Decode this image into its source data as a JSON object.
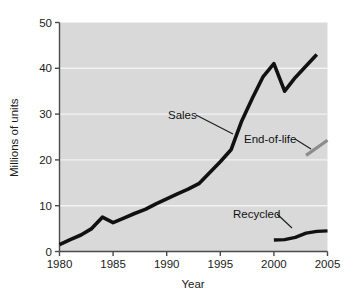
{
  "chart_data": {
    "type": "line",
    "title": "",
    "subtitle": "",
    "xlabel": "Year",
    "ylabel": "Millions of units",
    "xlim": [
      1980,
      2005
    ],
    "ylim": [
      0,
      50
    ],
    "xticks": [
      "1980",
      "1985",
      "1990",
      "1995",
      "2000",
      "2005"
    ],
    "yticks": [
      "0",
      "10",
      "20",
      "30",
      "40",
      "50"
    ],
    "xtick_values": [
      1980,
      1985,
      1990,
      1995,
      2000,
      2005
    ],
    "ytick_values": [
      0,
      10,
      20,
      30,
      40,
      50
    ],
    "grid": "horizontal-white-gridlines",
    "legend": "none-inline-annotations",
    "plot_background": "#d9d9d9",
    "page_background": "#ffffff",
    "series": [
      {
        "name": "Sales",
        "color": "#111111",
        "linewidth": 3.6,
        "x": [
          1980,
          1981,
          1982,
          1983,
          1984,
          1985,
          1986,
          1987,
          1988,
          1989,
          1990,
          1991,
          1992,
          1993,
          1994,
          1995,
          1996,
          1997,
          1998,
          1999,
          2000,
          2001,
          2002,
          2003,
          2004
        ],
        "values": [
          1.5,
          2.6,
          3.6,
          5.0,
          7.5,
          6.3,
          7.3,
          8.3,
          9.2,
          10.4,
          11.5,
          12.6,
          13.6,
          14.8,
          17.2,
          19.6,
          22.2,
          28.5,
          33.5,
          38.2,
          41.0,
          35.0,
          38.0,
          40.5,
          43.0
        ]
      },
      {
        "name": "End-of-life",
        "color": "#8c8c8c",
        "linewidth": 3.2,
        "x": [
          2003,
          2005
        ],
        "values": [
          21.0,
          24.3
        ]
      },
      {
        "name": "Recycled",
        "color": "#111111",
        "linewidth": 3.4,
        "x": [
          2000,
          2001,
          2002,
          2003,
          2004,
          2005
        ],
        "values": [
          2.5,
          2.6,
          3.1,
          4.0,
          4.4,
          4.5
        ]
      }
    ],
    "annotations": [
      {
        "text": "Sales",
        "label_x": 168,
        "label_y": 119,
        "leader_from_x": 196,
        "leader_from_y": 115,
        "leader_to_x": 233,
        "leader_to_y": 134
      },
      {
        "text": "End-of-life",
        "label_x": 244,
        "label_y": 143,
        "leader_from_x": 295,
        "leader_from_y": 139,
        "leader_to_x": 311,
        "leader_to_y": 149
      },
      {
        "text": "Recycled",
        "label_x": 233,
        "label_y": 218,
        "leader_from_x": 277,
        "leader_from_y": 214,
        "leader_to_x": 292,
        "leader_to_y": 228
      }
    ]
  },
  "axes": {
    "y_title": "Millions of units",
    "x_title": "Year"
  }
}
